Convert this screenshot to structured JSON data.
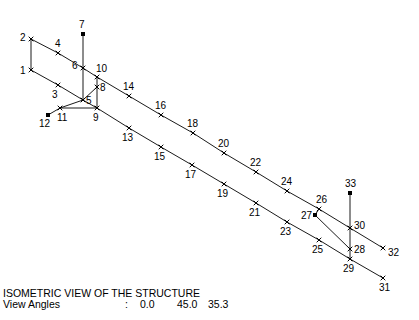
{
  "caption": {
    "title": "ISOMETRIC VIEW OF THE STRUCTURE",
    "angles_label": "View Angles",
    "separator": ":",
    "angles": [
      "0.0",
      "45.0",
      "35.3"
    ]
  },
  "nodes": [
    {
      "id": "1",
      "x": 31,
      "y": 70,
      "type": "x",
      "lx": -11,
      "ly": 4
    },
    {
      "id": "2",
      "x": 31,
      "y": 39,
      "type": "x",
      "lx": -11,
      "ly": 2
    },
    {
      "id": "3",
      "x": 58,
      "y": 85,
      "type": "x",
      "lx": -6,
      "ly": 13
    },
    {
      "id": "4",
      "x": 58,
      "y": 53,
      "type": "x",
      "lx": -3,
      "ly": -6
    },
    {
      "id": "5",
      "x": 83,
      "y": 100,
      "type": "x",
      "lx": 3,
      "ly": 4
    },
    {
      "id": "6",
      "x": 83,
      "y": 68,
      "type": "x",
      "lx": -11,
      "ly": 1
    },
    {
      "id": "7",
      "x": 83,
      "y": 34,
      "type": "sq",
      "lx": -4,
      "ly": -6
    },
    {
      "id": "8",
      "x": 97,
      "y": 87,
      "type": "x",
      "lx": 3,
      "ly": 4
    },
    {
      "id": "9",
      "x": 97,
      "y": 108,
      "type": "x",
      "lx": -4,
      "ly": 13
    },
    {
      "id": "10",
      "x": 97,
      "y": 77,
      "type": "x",
      "lx": -1,
      "ly": -5
    },
    {
      "id": "11",
      "x": 60,
      "y": 108,
      "type": "x",
      "lx": -3,
      "ly": 13
    },
    {
      "id": "12",
      "x": 48,
      "y": 115,
      "type": "sq",
      "lx": -9,
      "ly": 12
    },
    {
      "id": "13",
      "x": 129,
      "y": 128,
      "type": "x",
      "lx": -7,
      "ly": 13
    },
    {
      "id": "14",
      "x": 129,
      "y": 96,
      "type": "x",
      "lx": -6,
      "ly": -6
    },
    {
      "id": "15",
      "x": 161,
      "y": 147,
      "type": "x",
      "lx": -7,
      "ly": 13
    },
    {
      "id": "16",
      "x": 161,
      "y": 115,
      "type": "x",
      "lx": -6,
      "ly": -6
    },
    {
      "id": "17",
      "x": 192,
      "y": 165,
      "type": "x",
      "lx": -7,
      "ly": 13
    },
    {
      "id": "18",
      "x": 193,
      "y": 133,
      "type": "x",
      "lx": -6,
      "ly": -6
    },
    {
      "id": "19",
      "x": 224,
      "y": 184,
      "type": "x",
      "lx": -7,
      "ly": 13
    },
    {
      "id": "20",
      "x": 224,
      "y": 153,
      "type": "x",
      "lx": -6,
      "ly": -6
    },
    {
      "id": "21",
      "x": 256,
      "y": 203,
      "type": "x",
      "lx": -7,
      "ly": 13
    },
    {
      "id": "22",
      "x": 256,
      "y": 172,
      "type": "x",
      "lx": -6,
      "ly": -6
    },
    {
      "id": "23",
      "x": 287,
      "y": 222,
      "type": "x",
      "lx": -7,
      "ly": 13
    },
    {
      "id": "24",
      "x": 287,
      "y": 191,
      "type": "x",
      "lx": -6,
      "ly": -6
    },
    {
      "id": "25",
      "x": 319,
      "y": 240,
      "type": "x",
      "lx": -7,
      "ly": 13
    },
    {
      "id": "26",
      "x": 319,
      "y": 209,
      "type": "x",
      "lx": -3,
      "ly": -6
    },
    {
      "id": "27",
      "x": 315,
      "y": 215,
      "type": "sq",
      "lx": -14,
      "ly": 4
    },
    {
      "id": "28",
      "x": 350,
      "y": 249,
      "type": "x",
      "lx": 4,
      "ly": 4
    },
    {
      "id": "29",
      "x": 350,
      "y": 259,
      "type": "x",
      "lx": -7,
      "ly": 13
    },
    {
      "id": "30",
      "x": 350,
      "y": 228,
      "type": "x",
      "lx": 4,
      "ly": 1
    },
    {
      "id": "31",
      "x": 383,
      "y": 278,
      "type": "x",
      "lx": -4,
      "ly": 13
    },
    {
      "id": "32",
      "x": 383,
      "y": 248,
      "type": "x",
      "lx": 5,
      "ly": 8
    },
    {
      "id": "33",
      "x": 350,
      "y": 193,
      "type": "sq",
      "lx": -5,
      "ly": -6
    }
  ],
  "members": [
    [
      "1",
      "2"
    ],
    [
      "2",
      "4"
    ],
    [
      "4",
      "6"
    ],
    [
      "6",
      "10"
    ],
    [
      "10",
      "14"
    ],
    [
      "14",
      "16"
    ],
    [
      "16",
      "18"
    ],
    [
      "18",
      "20"
    ],
    [
      "20",
      "22"
    ],
    [
      "22",
      "24"
    ],
    [
      "24",
      "26"
    ],
    [
      "26",
      "30"
    ],
    [
      "30",
      "32"
    ],
    [
      "1",
      "3"
    ],
    [
      "3",
      "5"
    ],
    [
      "5",
      "9"
    ],
    [
      "9",
      "13"
    ],
    [
      "13",
      "15"
    ],
    [
      "15",
      "17"
    ],
    [
      "17",
      "19"
    ],
    [
      "19",
      "21"
    ],
    [
      "21",
      "23"
    ],
    [
      "23",
      "25"
    ],
    [
      "25",
      "29"
    ],
    [
      "29",
      "31"
    ],
    [
      "7",
      "6"
    ],
    [
      "6",
      "5"
    ],
    [
      "10",
      "8"
    ],
    [
      "8",
      "9"
    ],
    [
      "11",
      "5"
    ],
    [
      "5",
      "8"
    ],
    [
      "11",
      "9"
    ],
    [
      "12",
      "11"
    ],
    [
      "33",
      "30"
    ],
    [
      "30",
      "28"
    ],
    [
      "28",
      "29"
    ],
    [
      "27",
      "26"
    ],
    [
      "27",
      "28"
    ]
  ]
}
